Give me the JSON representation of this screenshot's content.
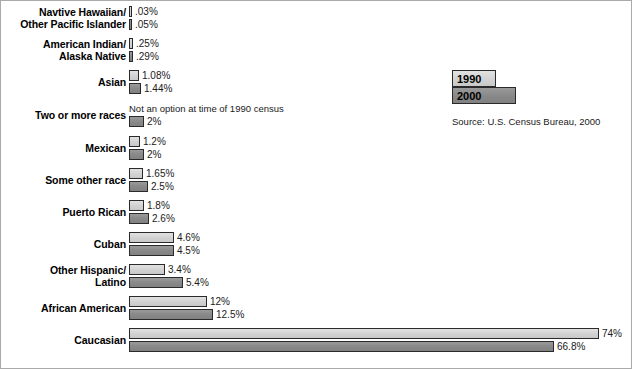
{
  "chart_data": {
    "type": "bar",
    "title": "",
    "xlabel": "",
    "ylabel": "",
    "orientation": "horizontal",
    "grid": false,
    "xlim": [
      0,
      74
    ],
    "legend_position": "top-right",
    "source": "Source: U.S. Census Bureau, 2000",
    "series": [
      {
        "name": "1990",
        "color": "#d5d5d5",
        "values": [
          0.03,
          0.25,
          1.08,
          null,
          1.2,
          1.65,
          1.8,
          4.6,
          3.4,
          12,
          74
        ]
      },
      {
        "name": "2000",
        "color": "#8b8b8b",
        "values": [
          0.05,
          0.29,
          1.44,
          2,
          2,
          2.5,
          2.6,
          4.5,
          5.4,
          12.5,
          66.8
        ]
      }
    ],
    "categories": [
      "Navtive Hawaiian/\nOther Pacific Islander",
      "American Indian/\nAlaska Native",
      "Asian",
      "Two or more races",
      "Mexican",
      "Some other race",
      "Puerto Rican",
      "Cuban",
      "Other Hispanic/\nLatino",
      "African American",
      "Caucasian"
    ],
    "value_labels_1990": [
      ".03%",
      ".25%",
      "1.08%",
      "",
      "1.2%",
      "1.65%",
      "1.8%",
      "4.6%",
      "3.4%",
      "12%",
      "74%"
    ],
    "value_labels_2000": [
      ".05%",
      ".29%",
      "1.44%",
      "2%",
      "2%",
      "2.5%",
      "2.6%",
      "4.5%",
      "5.4%",
      "12.5%",
      "66.8%"
    ],
    "annotations": [
      {
        "category": "Two or more races",
        "series": "1990",
        "text": "Not an option at time of 1990 census"
      }
    ]
  },
  "legend": {
    "items": [
      {
        "label": "1990",
        "color": "#d5d5d5"
      },
      {
        "label": "2000",
        "color": "#8b8b8b"
      }
    ]
  },
  "rows": [
    {
      "label": "Navtive Hawaiian/\nOther Pacific Islander",
      "v1990": ".03%",
      "v2000": ".05%",
      "w1990": 3,
      "w2000": 3,
      "note": ""
    },
    {
      "label": "American Indian/\nAlaska Native",
      "v1990": ".25%",
      "v2000": ".29%",
      "w1990": 4,
      "w2000": 4,
      "note": ""
    },
    {
      "label": "Asian",
      "v1990": "1.08%",
      "v2000": "1.44%",
      "w1990": 10,
      "w2000": 12,
      "note": ""
    },
    {
      "label": "Two or more races",
      "v1990": "",
      "v2000": "2%",
      "w1990": 0,
      "w2000": 15,
      "note": "Not an option at time of 1990 census"
    },
    {
      "label": "Mexican",
      "v1990": "1.2%",
      "v2000": "2%",
      "w1990": 11,
      "w2000": 15,
      "note": ""
    },
    {
      "label": "Some other race",
      "v1990": "1.65%",
      "v2000": "2.5%",
      "w1990": 14,
      "w2000": 19,
      "note": ""
    },
    {
      "label": "Puerto Rican",
      "v1990": "1.8%",
      "v2000": "2.6%",
      "w1990": 15,
      "w2000": 20,
      "note": ""
    },
    {
      "label": "Cuban",
      "v1990": "4.6%",
      "v2000": "4.5%",
      "w1990": 45,
      "w2000": 45,
      "note": ""
    },
    {
      "label": "Other Hispanic/\nLatino",
      "v1990": "3.4%",
      "v2000": "5.4%",
      "w1990": 36,
      "w2000": 54,
      "note": ""
    },
    {
      "label": "African American",
      "v1990": "12%",
      "v2000": "12.5%",
      "w1990": 78,
      "w2000": 84,
      "note": ""
    },
    {
      "label": "Caucasian",
      "v1990": "74%",
      "v2000": "66.8%",
      "w1990": 470,
      "w2000": 425,
      "note": ""
    }
  ],
  "source": "Source: U.S. Census Bureau, 2000"
}
